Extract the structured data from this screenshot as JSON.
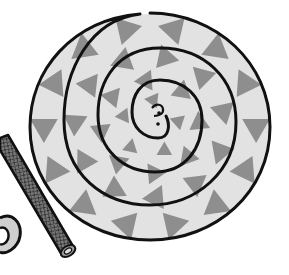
{
  "image": {
    "description": "Grayscale illustration of a coiled spiral disc with triangle pattern, beside a cross-hatched tube and a small coil",
    "subject": "coiled spiral",
    "colors": {
      "background": "#ffffff",
      "disc_fill": "#e2e2e2",
      "triangle_fill": "#8e8e8e",
      "outline": "#111111",
      "tube_fill": "#6e6e6e",
      "tube_hatch": "#2a2a2a"
    },
    "triangle_count_per_ring": [
      14,
      11,
      8,
      5
    ]
  }
}
